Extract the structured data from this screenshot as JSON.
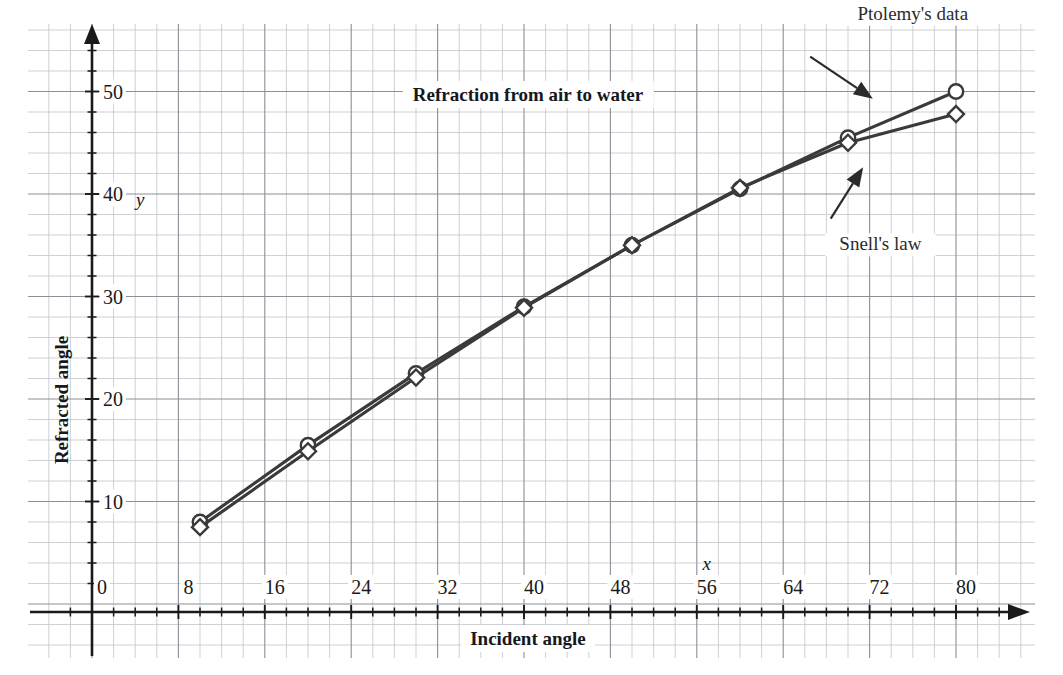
{
  "chart_data": {
    "type": "line",
    "title": "Refraction from air to water",
    "xlabel": "Incident angle",
    "ylabel": "Refracted angle",
    "x_var": "x",
    "y_var": "y",
    "xlim": [
      -3,
      85
    ],
    "ylim": [
      -2.5,
      56
    ],
    "xticks": [
      0,
      8,
      16,
      24,
      32,
      40,
      48,
      56,
      64,
      72,
      80
    ],
    "yticks": [
      0,
      10,
      20,
      30,
      40,
      50
    ],
    "xtick_labels": [
      "0",
      "8",
      "16",
      "24",
      "32",
      "40",
      "48",
      "56",
      "64",
      "72",
      "80"
    ],
    "ytick_labels": [
      "0",
      "10",
      "20",
      "30",
      "40",
      "50"
    ],
    "grid": true,
    "grid_minor": true,
    "legend_position": "inline-annotations",
    "x": [
      10,
      20,
      30,
      40,
      50,
      60,
      70,
      80
    ],
    "series": [
      {
        "name": "Ptolemy's data",
        "marker": "circle",
        "values": [
          8.0,
          15.5,
          22.5,
          29.0,
          35.0,
          40.5,
          45.5,
          50.0
        ]
      },
      {
        "name": "Snell's law",
        "marker": "diamond",
        "values": [
          7.5,
          14.9,
          22.1,
          28.9,
          35.0,
          40.6,
          45.0,
          47.8
        ]
      }
    ],
    "annotations": [
      {
        "text": "Ptolemy's data",
        "label_x": 76,
        "label_y": 57,
        "arrow_from_x": 66.5,
        "arrow_from_y": 53.4,
        "arrow_to_x": 72.3,
        "arrow_to_y": 49.3
      },
      {
        "text": "Snell's law",
        "label_x": 73,
        "label_y": 34.5,
        "arrow_from_x": 68.4,
        "arrow_from_y": 37.6,
        "arrow_to_x": 71.4,
        "arrow_to_y": 42.6
      }
    ],
    "colors": {
      "line": "#3a3a3a",
      "grid_major": "#8d8f96",
      "grid_minor": "#c3c5cb",
      "axis": "#1a1a1a",
      "text": "#1a1a1a",
      "background": "#ffffff"
    }
  }
}
